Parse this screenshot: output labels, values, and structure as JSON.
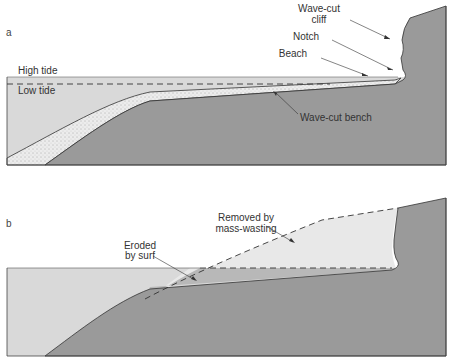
{
  "panel_a": {
    "letter": "a",
    "labels": {
      "high_tide": "High tide",
      "low_tide": "Low tide",
      "cliff_line1": "Wave-cut",
      "cliff_line2": "cliff",
      "notch": "Notch",
      "beach": "Beach",
      "bench": "Wave-cut bench"
    }
  },
  "panel_b": {
    "letter": "b",
    "labels": {
      "eroded_line1": "Eroded",
      "eroded_line2": "by surf",
      "removed_line1": "Removed by",
      "removed_line2": "mass-wasting"
    }
  },
  "colors": {
    "water": "#d9d9d9",
    "rock": "#9a9a9a",
    "removed": "#e6e6e6",
    "outline": "#333333"
  }
}
